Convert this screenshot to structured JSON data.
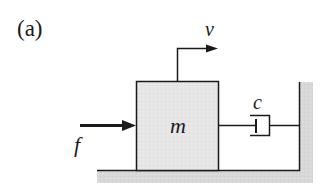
{
  "figure": {
    "panel_label": "(a)",
    "mass_label": "m",
    "force_label": "f",
    "velocity_label": "v",
    "damper_label": "c"
  },
  "colors": {
    "line": "#1a1a1a",
    "mass_fill": "#e4e4e4",
    "ground_fill": "#d6d6d6",
    "background": "#ffffff"
  }
}
